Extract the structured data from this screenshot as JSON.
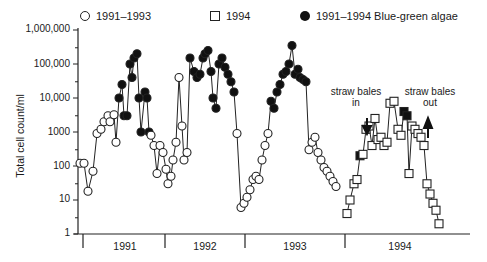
{
  "legend": {
    "items": [
      {
        "label": "1991–1993",
        "symbol": "open-circle"
      },
      {
        "label": "1994",
        "symbol": "open-square"
      },
      {
        "label": "1991–1994 Blue-green algae",
        "symbol": "filled"
      }
    ]
  },
  "axes": {
    "ylabel": "Total cell count/ml",
    "yticks": [
      "1,000,000",
      "100,000",
      "10,000",
      "1000",
      "100",
      "10",
      "1"
    ],
    "years": [
      "1991",
      "1992",
      "1993",
      "1994"
    ]
  },
  "annotations": {
    "bales_in": [
      "straw bales",
      "in"
    ],
    "bales_out": [
      "straw bales",
      "out"
    ]
  },
  "chart_data": {
    "type": "line",
    "title": "",
    "xlabel": "",
    "ylabel": "Total cell count/ml",
    "yscale": "log",
    "ylim": [
      1,
      1000000
    ],
    "x_categories": [
      "1991",
      "1992",
      "1993",
      "1994"
    ],
    "legend_position": "top",
    "grid": false,
    "series": [
      {
        "name": "1991–1993",
        "marker": "open-circle",
        "points": [
          [
            80,
            120,
            0
          ],
          [
            84,
            120,
            0
          ],
          [
            88,
            18,
            0
          ],
          [
            93,
            70,
            0
          ],
          [
            97,
            900,
            0
          ],
          [
            101,
            1200,
            0
          ],
          [
            104,
            2000,
            0
          ],
          [
            108,
            3000,
            0
          ],
          [
            110,
            2000,
            0
          ],
          [
            114,
            3200,
            0
          ],
          [
            116,
            500,
            0
          ],
          [
            119,
            10000,
            1
          ],
          [
            122,
            25000,
            1
          ],
          [
            124,
            3000,
            1
          ],
          [
            127,
            3000,
            1
          ],
          [
            130,
            100000,
            1
          ],
          [
            132,
            40000,
            1
          ],
          [
            134,
            150000,
            1
          ],
          [
            137,
            200000,
            1
          ],
          [
            139,
            10000,
            1
          ],
          [
            141,
            1000,
            1
          ],
          [
            145,
            15000,
            1
          ],
          [
            147,
            10000,
            1
          ],
          [
            149,
            1000,
            1
          ],
          [
            151,
            800,
            0
          ],
          [
            154,
            400,
            0
          ],
          [
            157,
            60,
            0
          ],
          [
            160,
            400,
            0
          ],
          [
            163,
            250,
            0
          ],
          [
            166,
            80,
            0
          ],
          [
            168,
            30,
            0
          ],
          [
            171,
            50,
            0
          ],
          [
            173,
            150,
            0
          ],
          [
            176,
            500,
            0
          ],
          [
            179,
            40000,
            0
          ],
          [
            182,
            1500,
            0
          ],
          [
            184,
            150,
            0
          ],
          [
            187,
            250,
            0
          ],
          [
            190,
            150000,
            1
          ],
          [
            194,
            60000,
            1
          ],
          [
            197,
            40000,
            1
          ],
          [
            200,
            50000,
            1
          ],
          [
            203,
            150000,
            1
          ],
          [
            205,
            200000,
            1
          ],
          [
            208,
            250000,
            1
          ],
          [
            211,
            60000,
            1
          ],
          [
            213,
            10000,
            1
          ],
          [
            216,
            5000,
            1
          ],
          [
            219,
            100000,
            1
          ],
          [
            222,
            150000,
            1
          ],
          [
            225,
            80000,
            1
          ],
          [
            228,
            50000,
            1
          ],
          [
            231,
            30000,
            1
          ],
          [
            234,
            15000,
            1
          ],
          [
            237,
            900,
            0
          ],
          [
            241,
            6,
            0
          ],
          [
            244,
            8,
            0
          ],
          [
            247,
            12,
            0
          ],
          [
            250,
            20,
            0
          ],
          [
            253,
            40,
            0
          ],
          [
            256,
            50,
            0
          ],
          [
            259,
            40,
            0
          ],
          [
            262,
            150,
            0
          ],
          [
            265,
            400,
            0
          ],
          [
            268,
            900,
            0
          ],
          [
            271,
            8000,
            1
          ],
          [
            274,
            5000,
            1
          ],
          [
            277,
            15000,
            1
          ],
          [
            280,
            25000,
            1
          ],
          [
            283,
            50000,
            1
          ],
          [
            286,
            60000,
            1
          ],
          [
            289,
            100000,
            1
          ],
          [
            292,
            350000,
            1
          ],
          [
            295,
            50000,
            1
          ],
          [
            298,
            70000,
            1
          ],
          [
            300,
            40000,
            1
          ],
          [
            303,
            35000,
            1
          ],
          [
            306,
            30000,
            1
          ],
          [
            309,
            300,
            0
          ],
          [
            312,
            500,
            0
          ],
          [
            315,
            700,
            0
          ],
          [
            318,
            250,
            0
          ],
          [
            321,
            150,
            0
          ],
          [
            324,
            90,
            0
          ],
          [
            327,
            70,
            0
          ],
          [
            330,
            50,
            0
          ],
          [
            333,
            35,
            0
          ],
          [
            336,
            25,
            0
          ]
        ]
      },
      {
        "name": "1994",
        "marker": "open-square",
        "points": [
          [
            347,
            4,
            0
          ],
          [
            350,
            10,
            0
          ],
          [
            354,
            30,
            0
          ],
          [
            357,
            40,
            0
          ],
          [
            360,
            200,
            1
          ],
          [
            363,
            220,
            0
          ],
          [
            366,
            1200,
            0
          ],
          [
            369,
            1500,
            0
          ],
          [
            372,
            400,
            0
          ],
          [
            375,
            2500,
            0
          ],
          [
            378,
            600,
            0
          ],
          [
            381,
            700,
            0
          ],
          [
            384,
            400,
            0
          ],
          [
            387,
            500,
            0
          ],
          [
            390,
            7000,
            0
          ],
          [
            394,
            8000,
            0
          ],
          [
            398,
            1200,
            0
          ],
          [
            401,
            800,
            0
          ],
          [
            404,
            4000,
            1
          ],
          [
            407,
            3000,
            1
          ],
          [
            409,
            60,
            0
          ],
          [
            412,
            1500,
            0
          ],
          [
            415,
            1200,
            0
          ],
          [
            418,
            900,
            0
          ],
          [
            421,
            700,
            0
          ],
          [
            424,
            400,
            0
          ],
          [
            427,
            30,
            0
          ],
          [
            430,
            15,
            0
          ],
          [
            433,
            8,
            0
          ],
          [
            436,
            5,
            0
          ],
          [
            439,
            2,
            0
          ]
        ]
      }
    ],
    "annotations": [
      {
        "text": "straw bales in",
        "arrow": "down",
        "x": 368
      },
      {
        "text": "straw bales out",
        "arrow": "up",
        "x": 428
      }
    ]
  }
}
